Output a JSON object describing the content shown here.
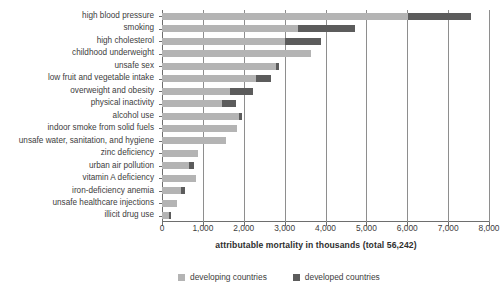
{
  "chart_data": {
    "type": "bar",
    "orientation": "horizontal",
    "stacked": true,
    "title": "",
    "xlabel": "attributable mortality in thousands (total 56,242)",
    "ylabel": "",
    "xlim": [
      0,
      8000
    ],
    "ylim": null,
    "grid": true,
    "legend_position": "bottom",
    "xticks": [
      0,
      1000,
      2000,
      3000,
      4000,
      5000,
      6000,
      7000,
      8000
    ],
    "xtick_labels": [
      "0",
      "1,000",
      "2,000",
      "3,000",
      "4,000",
      "5,000",
      "6,000",
      "7,000",
      "8,000"
    ],
    "total_label": "total 56,242",
    "categories": [
      "high blood pressure",
      "smoking",
      "high cholesterol",
      "childhood underweight",
      "unsafe sex",
      "low fruit and vegetable intake",
      "overweight and obesity",
      "physical inactivity",
      "alcohol use",
      "indoor smoke from solid fuels",
      "unsafe water, sanitation, and hygiene",
      "zinc deficiency",
      "urban air pollution",
      "vitamin A deficiency",
      "iron-deficiency anemia",
      "unsafe healthcare injections",
      "illicit drug use"
    ],
    "series": [
      {
        "name": "developing countries",
        "color": "#b4b4b4",
        "values": [
          6030,
          3320,
          3000,
          3640,
          2800,
          2290,
          1660,
          1460,
          1880,
          1830,
          1560,
          880,
          660,
          830,
          465,
          365,
          160
        ]
      },
      {
        "name": "developed countries",
        "color": "#5c5c5c",
        "values": [
          1540,
          1390,
          900,
          0,
          60,
          370,
          560,
          340,
          70,
          0,
          0,
          0,
          120,
          0,
          95,
          0,
          60
        ]
      }
    ],
    "totals": [
      7570,
      4710,
      3900,
      3640,
      2860,
      2660,
      2220,
      1800,
      1950,
      1830,
      1560,
      880,
      780,
      830,
      560,
      365,
      220
    ]
  },
  "legend": {
    "items": [
      {
        "label": "developing countries",
        "color": "#b4b4b4"
      },
      {
        "label": "developed countries",
        "color": "#5c5c5c"
      }
    ]
  },
  "colors": {
    "developing": "#b4b4b4",
    "developed": "#5c5c5c",
    "axis": "#6e6e6e",
    "grid": "#8e8e8e",
    "text": "#3d3d3d",
    "background": "#ffffff"
  }
}
